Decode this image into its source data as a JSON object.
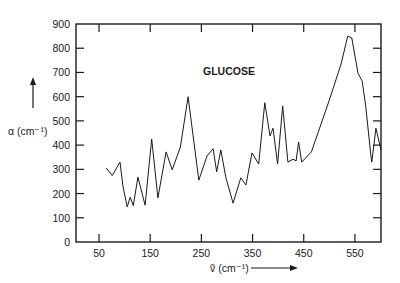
{
  "chart_data": {
    "type": "line",
    "title": "GLUCOSE",
    "xlabel": "ṽ (cm⁻¹)",
    "ylabel": "α (cm⁻¹)",
    "xlim": [
      5,
      601
    ],
    "ylim": [
      0,
      900
    ],
    "x_ticks": [
      50,
      150,
      250,
      350,
      450,
      550
    ],
    "y_ticks": [
      0,
      100,
      200,
      300,
      400,
      500,
      600,
      700,
      800,
      900
    ],
    "grid": false,
    "legend": null,
    "series": [
      {
        "name": "GLUCOSE",
        "x": [
          64,
          76,
          91,
          97,
          105,
          111,
          117,
          126,
          140,
          153,
          165,
          181,
          193,
          209,
          224,
          245,
          261,
          273,
          280,
          288,
          298,
          312,
          327,
          337,
          349,
          362,
          374,
          384,
          390,
          399,
          409,
          419,
          429,
          435,
          440,
          446,
          465,
          500,
          523,
          536,
          544,
          556,
          564,
          571,
          581,
          583,
          591,
          601
        ],
        "y": [
          305,
          275,
          330,
          227,
          145,
          185,
          150,
          268,
          152,
          425,
          182,
          372,
          298,
          392,
          600,
          255,
          355,
          385,
          290,
          380,
          265,
          160,
          265,
          235,
          368,
          322,
          575,
          438,
          470,
          322,
          562,
          330,
          342,
          335,
          413,
          330,
          372,
          586,
          735,
          850,
          842,
          697,
          665,
          565,
          360,
          330,
          470,
          380
        ]
      }
    ]
  }
}
